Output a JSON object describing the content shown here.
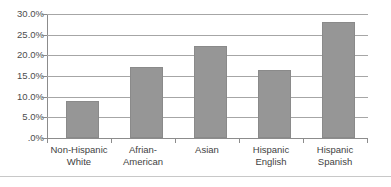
{
  "chart_data": {
    "type": "bar",
    "title": "",
    "subtitle": "",
    "xlabel": "",
    "ylabel": "",
    "categories": [
      "Non-Hispanic White",
      "Afrian-American",
      "Asian",
      "Hispanic English",
      "Hispanic Spanish"
    ],
    "category_lines": [
      [
        "Non-Hispanic",
        "White"
      ],
      [
        "Afrian-",
        "American"
      ],
      [
        "Asian",
        ""
      ],
      [
        "Hispanic",
        "English"
      ],
      [
        "Hispanic",
        "Spanish"
      ]
    ],
    "values": [
      8.9,
      17.2,
      22.3,
      16.4,
      28.1
    ],
    "value_unit": "%",
    "ylim": [
      0,
      30
    ],
    "ytick_values": [
      30,
      25,
      20,
      15,
      10,
      5,
      0
    ],
    "ytick_labels": [
      "30.0%",
      "25.0%",
      "20.0%",
      "15.0%",
      "10.0%",
      "5.0%",
      ".0%"
    ],
    "grid": true,
    "grid_axis": "y",
    "legend": false,
    "legend_position": "none",
    "bar_color": "#969696",
    "bar_edge_color": "#8a8a8a",
    "gridline_color": "#a6a6a6",
    "axis_color": "#8c8c8c",
    "text_color": "#4d4d4d"
  }
}
